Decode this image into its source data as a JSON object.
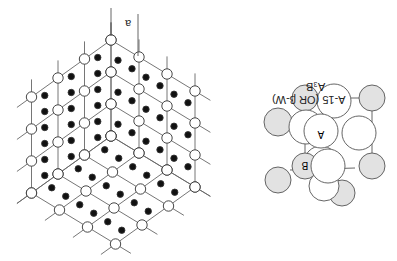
{
  "figure": {
    "orientation": "rotated-180",
    "lattice": {
      "label_spacing": "a",
      "cells_per_edge": 3,
      "open_circle": "lattice-site-B",
      "filled_circle": "lattice-site-A"
    },
    "unit_cell": {
      "title": "A-15 (OR β-W)",
      "formula": "A₃B",
      "atom_a_label": "A",
      "atom_b_label": "B",
      "colors": {
        "A": "#ffffff",
        "B": "#e2e2e2",
        "stroke": "#555555"
      }
    }
  }
}
